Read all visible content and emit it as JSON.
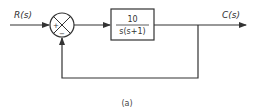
{
  "diagram": {
    "type": "block-diagram",
    "input_label": "R(s)",
    "output_label": "C(s)",
    "summing_junction": {
      "plus_sign": "+",
      "minus_sign": "−"
    },
    "block": {
      "numerator": "10",
      "denominator": "s(s+1)"
    },
    "feedback": "unity negative feedback",
    "caption": "(a)",
    "colors": {
      "line": "#333333",
      "background": "#ffffff"
    }
  }
}
